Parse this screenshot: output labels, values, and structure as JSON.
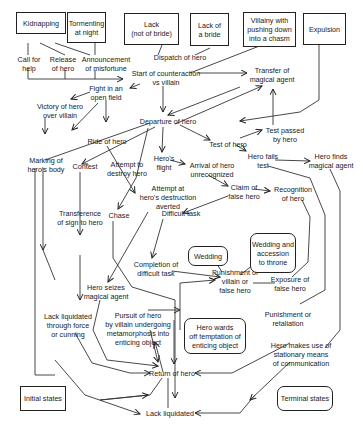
{
  "initial_boxes": [
    {
      "id": "kidnapping",
      "label": "Kidnapping"
    },
    {
      "id": "tormenting",
      "label": "Tormenting\nat night"
    },
    {
      "id": "lack_not_bride",
      "label": "Lack\n(not of bride)"
    },
    {
      "id": "lack_bride",
      "label": "Lack of\na bride"
    },
    {
      "id": "villainy_chasm",
      "label": "Villainy with\npushing down\ninto a chasm"
    },
    {
      "id": "expulsion",
      "label": "Expulsion"
    }
  ],
  "nodes": [
    {
      "id": "call_help",
      "label": "Call for\nhelp"
    },
    {
      "id": "release_hero",
      "label": "Release\nof hero"
    },
    {
      "id": "announcement",
      "label": "Announcement\nof misfortune"
    },
    {
      "id": "dispatch",
      "label": "Dispatch of hero"
    },
    {
      "id": "start_counteraction",
      "label": "Start of counteraction\nvs villain"
    },
    {
      "id": "transfer_agent",
      "label": "Transfer of\nmagical agent"
    },
    {
      "id": "fight_field",
      "label": "Fight in an\nopen field"
    },
    {
      "id": "victory",
      "label": "Victory of hero\nover villain"
    },
    {
      "id": "departure",
      "label": "Departure of hero"
    },
    {
      "id": "test_passed",
      "label": "Test passed\nby hero"
    },
    {
      "id": "ride",
      "label": "Ride of hero"
    },
    {
      "id": "test_hero",
      "label": "Test of hero"
    },
    {
      "id": "marking",
      "label": "Marking of\nhero's body"
    },
    {
      "id": "contest",
      "label": "Contest"
    },
    {
      "id": "attempt_destroy",
      "label": "Attempt to\ndestroy hero"
    },
    {
      "id": "heros_flight",
      "label": "Hero's\nflight"
    },
    {
      "id": "arrival_unrec",
      "label": "Arrival of hero\nunrecognized"
    },
    {
      "id": "hero_fails",
      "label": "Hero fails\ntest"
    },
    {
      "id": "hero_finds",
      "label": "Hero finds\nmagical agent"
    },
    {
      "id": "attempt_averted",
      "label": "Attempt at\nhero's destruction\naverted"
    },
    {
      "id": "claim_false",
      "label": "Claim of\nfalse hero"
    },
    {
      "id": "recognition",
      "label": "Recognition\nof hero"
    },
    {
      "id": "transference_sign",
      "label": "Transference\nof sign to hero"
    },
    {
      "id": "chase",
      "label": "Chase"
    },
    {
      "id": "difficult_task",
      "label": "Difficult task"
    },
    {
      "id": "completion_task",
      "label": "Completion of\ndifficult task"
    },
    {
      "id": "punishment_villain",
      "label": "Punishment of\nvillain or\nfalse hero"
    },
    {
      "id": "exposure",
      "label": "Exposure of\nfalse hero"
    },
    {
      "id": "hero_seizes",
      "label": "Hero seizes\nmagical agent"
    },
    {
      "id": "lack_force",
      "label": "Lack liquidated\nthrough force\nor cunning"
    },
    {
      "id": "pursuit",
      "label": "Pursuit of hero\nby villain undergoing\nmetamorphosis into\nenticing object"
    },
    {
      "id": "punishment_retaliation",
      "label": "Punishment or\nretaliation"
    },
    {
      "id": "stationary_means",
      "label": "Hero makes use of\nstationary means\nof communication"
    },
    {
      "id": "return",
      "label": "Return of hero"
    },
    {
      "id": "lack_liquidated",
      "label": "Lack liquidated"
    }
  ],
  "terminal_boxes": [
    {
      "id": "wedding",
      "label": "Wedding"
    },
    {
      "id": "wedding_throne",
      "label": "Wedding and\naccession\nto throne"
    },
    {
      "id": "hero_wards",
      "label": "Hero wards\noff temptation of\nenticing object"
    }
  ],
  "legend": {
    "initial_states": "Initial states",
    "terminal_states": "Terminal states"
  }
}
